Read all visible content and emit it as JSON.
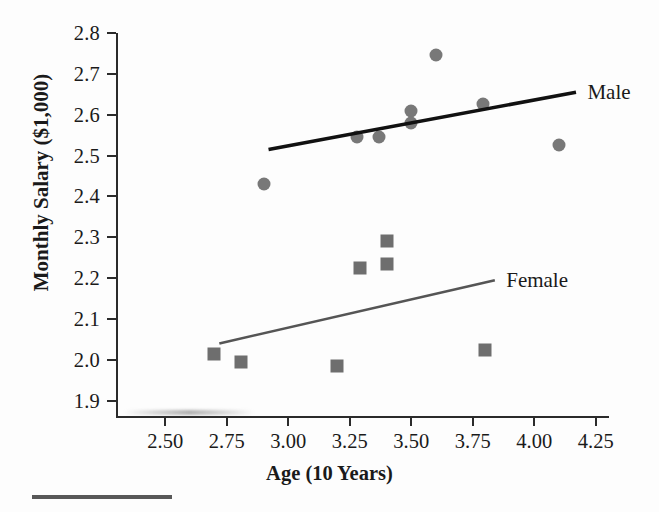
{
  "chart_data": {
    "type": "scatter",
    "title": "",
    "xlabel": "Age (10 Years)",
    "ylabel": "Monthly Salary ($1,000)",
    "xlim": [
      2.3,
      4.3
    ],
    "ylim": [
      1.86,
      2.8
    ],
    "grid": false,
    "legend_position": "inline-right-of-trendlines",
    "xticks": [
      "2.50",
      "2.75",
      "3.00",
      "3.25",
      "3.50",
      "3.75",
      "4.00",
      "4.25"
    ],
    "xtick_values": [
      2.5,
      2.75,
      3.0,
      3.25,
      3.5,
      3.75,
      4.0,
      4.25
    ],
    "yticks": [
      "2.8",
      "2.7",
      "2.6",
      "2.5",
      "2.4",
      "2.3",
      "2.2",
      "2.1",
      "2.0",
      "1.9"
    ],
    "ytick_values": [
      2.8,
      2.7,
      2.6,
      2.5,
      2.4,
      2.3,
      2.2,
      2.1,
      2.0,
      1.9
    ],
    "series": [
      {
        "name": "Male",
        "marker": "circle",
        "color": "#787878",
        "trendline_color": "#111111",
        "points": [
          {
            "x": 2.9,
            "y": 2.43
          },
          {
            "x": 3.28,
            "y": 2.545
          },
          {
            "x": 3.37,
            "y": 2.545
          },
          {
            "x": 3.5,
            "y": 2.61
          },
          {
            "x": 3.5,
            "y": 2.58
          },
          {
            "x": 3.6,
            "y": 2.745
          },
          {
            "x": 3.79,
            "y": 2.625
          },
          {
            "x": 4.1,
            "y": 2.525
          }
        ],
        "trendline": {
          "x1": 2.92,
          "y1": 2.515,
          "x2": 4.17,
          "y2": 2.655
        }
      },
      {
        "name": "Female",
        "marker": "square",
        "color": "#6e6e6e",
        "trendline_color": "#555555",
        "points": [
          {
            "x": 2.7,
            "y": 2.015
          },
          {
            "x": 2.81,
            "y": 1.995
          },
          {
            "x": 3.2,
            "y": 1.985
          },
          {
            "x": 3.29,
            "y": 2.225
          },
          {
            "x": 3.4,
            "y": 2.29
          },
          {
            "x": 3.4,
            "y": 2.235
          },
          {
            "x": 3.8,
            "y": 2.025
          }
        ],
        "trendline": {
          "x1": 2.72,
          "y1": 2.04,
          "x2": 3.84,
          "y2": 2.195
        }
      }
    ],
    "annotations": [
      {
        "text": "Male",
        "x": 4.2,
        "y": 2.655
      },
      {
        "text": "Female",
        "x": 3.87,
        "y": 2.195
      }
    ]
  }
}
